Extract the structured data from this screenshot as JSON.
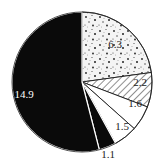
{
  "chart_data": {
    "type": "pie",
    "title": "",
    "start_angle_deg": 0,
    "direction": "clockwise",
    "slices": [
      {
        "label": "6.3",
        "value": 6.3,
        "fill": "speckled",
        "label_color": "#222222"
      },
      {
        "label": "2.2",
        "value": 2.2,
        "fill": "hatched",
        "label_color": "#222222"
      },
      {
        "label": "1.6",
        "value": 1.6,
        "fill": "white",
        "label_color": "#222222"
      },
      {
        "label": "1.5",
        "value": 1.5,
        "fill": "white",
        "label_color": "#222222"
      },
      {
        "label": "1.1",
        "value": 1.1,
        "fill": "black",
        "label_color": "#222222",
        "label_outside": true
      },
      {
        "label": "14.9",
        "value": 14.9,
        "fill": "black",
        "label_color": "#ffffff"
      }
    ],
    "categories": [
      "6.3",
      "2.2",
      "1.6",
      "1.5",
      "1.1",
      "14.9"
    ],
    "values": [
      6.3,
      2.2,
      1.6,
      1.5,
      1.1,
      14.9
    ],
    "legend": "none",
    "colors": {
      "black": "#0a0a0a",
      "white": "#ffffff",
      "stroke": "#1a1a1a"
    }
  }
}
